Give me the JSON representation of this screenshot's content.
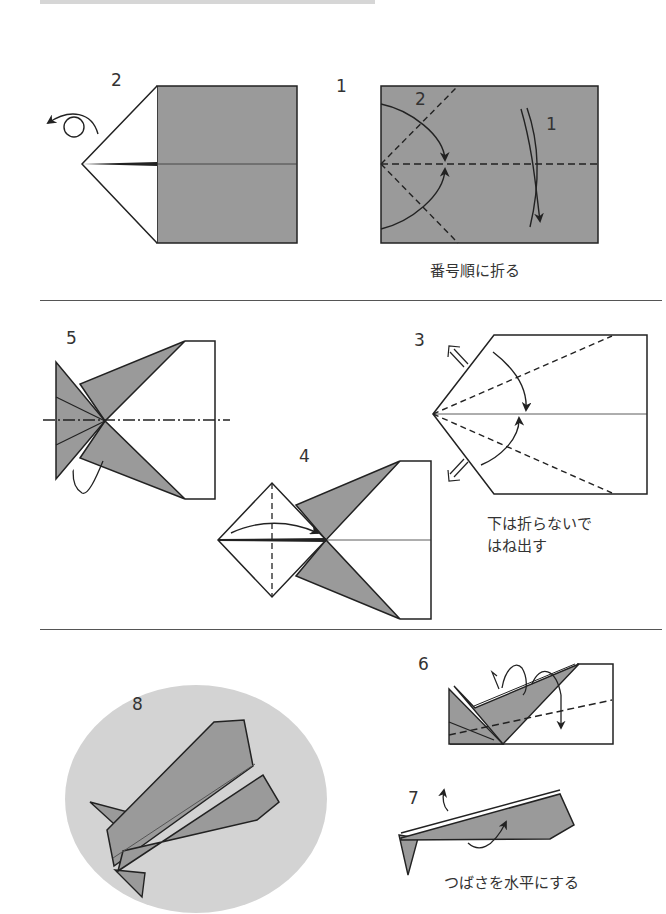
{
  "page": {
    "colors": {
      "paper_gray": "#9a9a9a",
      "ellipse_gray": "#d3d3d3",
      "line": "#222222"
    }
  },
  "section1": {
    "step2": {
      "label": "2"
    },
    "step1": {
      "label": "1",
      "inner_labels": [
        "2",
        "1"
      ],
      "caption": "番号順に折る"
    }
  },
  "section2": {
    "step5": {
      "label": "5"
    },
    "step4": {
      "label": "4"
    },
    "step3": {
      "label": "3",
      "caption_lines": [
        "下は折らないで",
        "はね出す"
      ]
    }
  },
  "section3": {
    "step8": {
      "label": "8"
    },
    "step6": {
      "label": "6"
    },
    "step7": {
      "label": "7",
      "caption": "つばさを水平にする"
    }
  }
}
